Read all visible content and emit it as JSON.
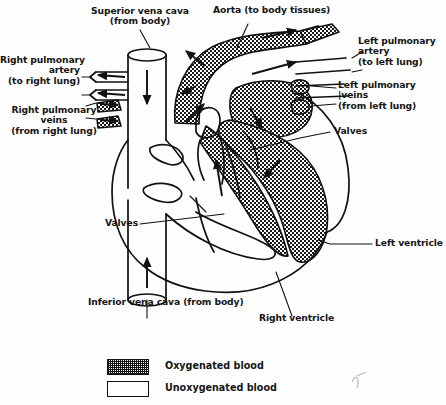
{
  "diagram": {
    "ink_color": "#111111",
    "background_color": "#ffffff"
  },
  "labels": {
    "superior_vena_cava": "Superior vena cava\n(from body)",
    "aorta": "Aorta (to body tissues)",
    "right_pulmonary_artery": "Right pulmonary\nartery\n(to right lung)",
    "left_pulmonary_artery": "Left pulmonary\nartery\n(to left lung)",
    "right_pulmonary_veins": "Right pulmonary\nveins\n(from right lung)",
    "left_pulmonary_veins": "Left pulmonary\n|veins\n(from left lung)",
    "valves_right": "Valves",
    "valves_left": "Valves",
    "left_ventricle": "Left ventricle",
    "right_ventricle": "Right ventricle",
    "inferior_vena_cava": "Inferior vena cava (from body)"
  },
  "legend": {
    "items": [
      {
        "label": "Oxygenated blood",
        "pattern": "cross-hatch"
      },
      {
        "label": "Unoxygenated blood",
        "pattern": "empty"
      }
    ]
  }
}
